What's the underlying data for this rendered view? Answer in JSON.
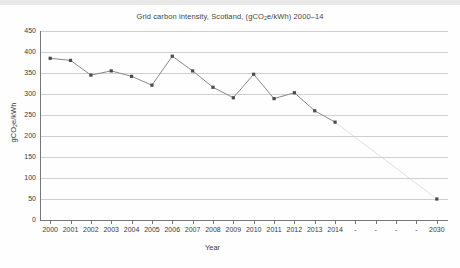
{
  "chart_data": {
    "type": "line",
    "title_parts": {
      "pre": "Grid carbon intensity, Scotland, (gCO",
      "sub": "2",
      "post": "e/kWh) 2000–14"
    },
    "xlabel": "Year",
    "ylabel": "gCO2e/kWh",
    "ylabel_parts": {
      "pre": "gCO",
      "sub": "2",
      "post": "e/kWh"
    },
    "ylim": [
      0,
      450
    ],
    "yticks": [
      0,
      50,
      100,
      150,
      200,
      250,
      300,
      350,
      400,
      450
    ],
    "ytick_labels": [
      "0",
      "50",
      "100",
      "150",
      "200",
      "250",
      "300",
      "350",
      "400",
      "450"
    ],
    "grid": true,
    "legend": "none",
    "xtick_labels": [
      "2000",
      "2001",
      "2002",
      "2003",
      "2004",
      "2005",
      "2006",
      "2007",
      "2008",
      "2009",
      "2010",
      "2011",
      "2012",
      "2013",
      "2014",
      "-",
      "-",
      "-",
      "-",
      "2030"
    ],
    "categories": [
      "2000",
      "2001",
      "2002",
      "2003",
      "2004",
      "2005",
      "2006",
      "2007",
      "2008",
      "2009",
      "2010",
      "2011",
      "2012",
      "2013",
      "2014",
      "2030"
    ],
    "series": [
      {
        "name": "Grid carbon intensity",
        "x": [
          2000,
          2001,
          2002,
          2003,
          2004,
          2005,
          2006,
          2007,
          2008,
          2009,
          2010,
          2011,
          2012,
          2013,
          2014
        ],
        "values": [
          385,
          380,
          345,
          355,
          342,
          321,
          390,
          355,
          316,
          291,
          347,
          289,
          303,
          260,
          233
        ],
        "color": "#7a7a7a",
        "marker": "square"
      },
      {
        "name": "Projection to 2030",
        "x": [
          2014,
          2030
        ],
        "values": [
          233,
          50
        ],
        "color": "#d8d8d8",
        "marker": "square",
        "style": "faint"
      }
    ],
    "annotations": []
  },
  "colors": {
    "line": "#7a7a7a",
    "marker": "#4a4a4a",
    "projection": "#dcdcdc",
    "grid": "#cfcfcf",
    "axis": "#777777",
    "text": "#3a3a3a",
    "background": "#fefefe",
    "topband": "#e8e8e8"
  }
}
